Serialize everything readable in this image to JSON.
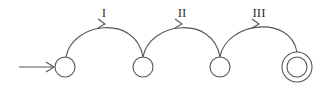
{
  "diagram": {
    "type": "state-machine",
    "stroke_color": "#555555",
    "background": "#ffffff",
    "states": [
      {
        "id": "s0",
        "cx": 65,
        "cy": 67,
        "r": 10,
        "initial": true,
        "accepting": false
      },
      {
        "id": "s1",
        "cx": 143,
        "cy": 67,
        "r": 10,
        "initial": false,
        "accepting": false
      },
      {
        "id": "s2",
        "cx": 220,
        "cy": 67,
        "r": 10,
        "initial": false,
        "accepting": false
      },
      {
        "id": "s3",
        "cx": 297,
        "cy": 67,
        "r": 10,
        "outer_r": 15,
        "initial": false,
        "accepting": true
      }
    ],
    "transitions": [
      {
        "from": "s0",
        "to": "s1",
        "label": "I"
      },
      {
        "from": "s1",
        "to": "s2",
        "label": "II"
      },
      {
        "from": "s2",
        "to": "s3",
        "label": "III"
      }
    ],
    "start_arrow": {
      "x1": 19,
      "y1": 67,
      "x2": 55,
      "y2": 67
    }
  }
}
